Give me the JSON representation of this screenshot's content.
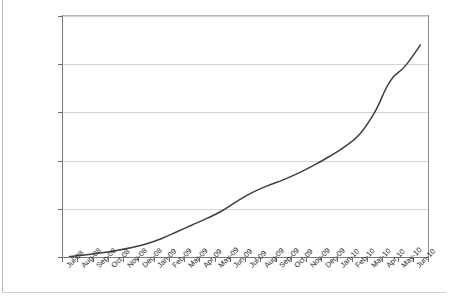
{
  "chart_data": {
    "type": "line",
    "title": "",
    "subtitle": "",
    "xlabel": "",
    "ylabel": "",
    "grid": "horizontal",
    "legend": "none",
    "xlim": [
      "Jul-08",
      "Jun-10"
    ],
    "ylim": [
      0,
      250000
    ],
    "ytick_labels": [
      "250000",
      "200000",
      "150000",
      "100000",
      "50000",
      "0"
    ],
    "ytick_values": [
      250000,
      200000,
      150000,
      100000,
      50000,
      0
    ],
    "categories": [
      "Jul-08",
      "Aug-08",
      "Sep-08",
      "Oct-08",
      "Nov-08",
      "Dec-08",
      "Jan-09",
      "Feb-09",
      "Mar-09",
      "Apr-09",
      "May-09",
      "Jun-09",
      "Jul-09",
      "Aug-09",
      "Sep-09",
      "Oct-09",
      "Nov-09",
      "Dec-09",
      "Jan-10",
      "Feb-10",
      "Mar-10",
      "Apr-10",
      "May-10",
      "Jun-10"
    ],
    "series": [
      {
        "name": "cumulative-total",
        "color": "#3f3f3f",
        "values": [
          500,
          2200,
          4200,
          6500,
          9500,
          13500,
          19000,
          26000,
          33000,
          40000,
          48000,
          58000,
          67000,
          74000,
          80000,
          87000,
          95000,
          104000,
          114000,
          127000,
          150000,
          182000,
          198000,
          220000
        ]
      }
    ]
  },
  "axes": {
    "y": {
      "ticks": [
        {
          "label": "250000",
          "value": 250000
        },
        {
          "label": "200000",
          "value": 200000
        },
        {
          "label": "150000",
          "value": 150000
        },
        {
          "label": "100000",
          "value": 100000
        },
        {
          "label": "50000",
          "value": 50000
        },
        {
          "label": "0",
          "value": 0
        }
      ]
    },
    "x": {
      "ticks": [
        {
          "label": "Jul-08"
        },
        {
          "label": "Aug-08"
        },
        {
          "label": "Sep-08"
        },
        {
          "label": "Oct-08"
        },
        {
          "label": "Nov-08"
        },
        {
          "label": "Dec-08"
        },
        {
          "label": "Jan-09"
        },
        {
          "label": "Feb-09"
        },
        {
          "label": "Mar-09"
        },
        {
          "label": "Apr-09"
        },
        {
          "label": "May-09"
        },
        {
          "label": "Jun-09"
        },
        {
          "label": "Jul-09"
        },
        {
          "label": "Aug-09"
        },
        {
          "label": "Sep-09"
        },
        {
          "label": "Oct-09"
        },
        {
          "label": "Nov-09"
        },
        {
          "label": "Dec-09"
        },
        {
          "label": "Jan-10"
        },
        {
          "label": "Feb-10"
        },
        {
          "label": "Mar-10"
        },
        {
          "label": "Apr-10"
        },
        {
          "label": "May-10"
        },
        {
          "label": "Jun-10"
        }
      ]
    }
  }
}
